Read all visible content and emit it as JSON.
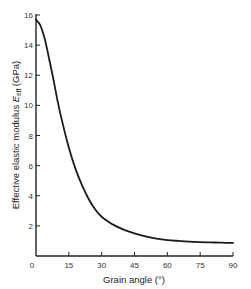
{
  "chart_data": {
    "type": "line",
    "title": "",
    "xlabel": "Grain angle (°)",
    "ylabel": "Effective elastic modulus E_eff (GPa)",
    "ylabel_main": "Effective elastic modulus ",
    "ylabel_symbol": "E",
    "ylabel_subscript": "eff",
    "ylabel_unit": " (GPa)",
    "xlim": [
      0,
      90
    ],
    "ylim": [
      0,
      16
    ],
    "xticks": [
      0,
      15,
      30,
      45,
      60,
      75,
      90
    ],
    "yticks": [
      2,
      4,
      6,
      8,
      10,
      12,
      14,
      16
    ],
    "grid": false,
    "legend": null,
    "series": [
      {
        "name": "E_eff",
        "x": [
          0,
          2,
          4,
          6,
          8,
          10,
          12,
          15,
          18,
          21,
          24,
          27,
          30,
          35,
          40,
          45,
          50,
          55,
          60,
          65,
          70,
          75,
          80,
          85,
          90
        ],
        "values": [
          15.7,
          15.3,
          14.4,
          13.1,
          11.7,
          10.2,
          8.9,
          7.2,
          5.8,
          4.7,
          3.8,
          3.1,
          2.6,
          2.1,
          1.75,
          1.5,
          1.3,
          1.15,
          1.05,
          1.0,
          0.95,
          0.92,
          0.9,
          0.88,
          0.87
        ]
      }
    ]
  }
}
